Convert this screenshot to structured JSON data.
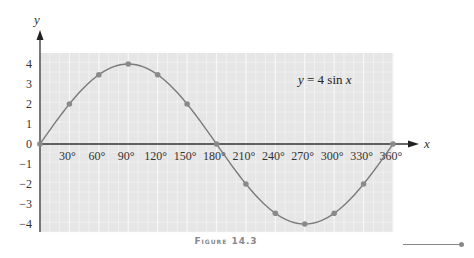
{
  "caption": "Figure 14.3",
  "equation": {
    "lhs": "y",
    "eq": " = 4 sin ",
    "var": "x"
  },
  "axes": {
    "x_label": "x",
    "y_label": "y"
  },
  "colors": {
    "grid_bg": "#e6e6e6",
    "grid_line": "#f7f7f7",
    "curve": "#7a7a7a",
    "marker": "#8a8a8a",
    "axis": "#333333"
  },
  "chart_data": {
    "type": "line",
    "title": "y = 4 sin x",
    "xlabel": "x",
    "ylabel": "y",
    "x": [
      0,
      30,
      60,
      90,
      120,
      150,
      180,
      210,
      240,
      270,
      300,
      330,
      360
    ],
    "series": [
      {
        "name": "y = 4 sin x",
        "values": [
          0,
          2,
          3.46,
          4,
          3.46,
          2,
          0,
          -2,
          -3.46,
          -4,
          -3.46,
          -2,
          0
        ]
      }
    ],
    "x_tick_labels": [
      "30°",
      "60°",
      "90°",
      "120°",
      "150°",
      "180°",
      "210°",
      "240°",
      "270°",
      "300°",
      "330°",
      "360°"
    ],
    "y_tick_labels": [
      "4",
      "3",
      "2",
      "1",
      "0",
      "−1",
      "−2",
      "−3",
      "−4"
    ],
    "xlim": [
      0,
      360
    ],
    "ylim": [
      -4.4,
      4.4
    ],
    "grid": true,
    "markers": true,
    "legend": "none"
  }
}
